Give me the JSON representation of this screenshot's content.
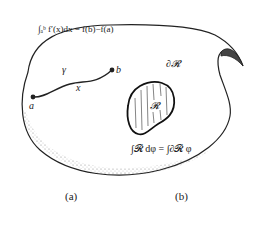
{
  "figure": {
    "panel_a": {
      "caption": "(a)",
      "formula": "∫ₐᵇ f′(x)dx = f(b)−f(a)",
      "curve_label": "γ",
      "variable_label": "x",
      "start_point_label": "a",
      "end_point_label": "b"
    },
    "panel_b": {
      "caption": "(b)",
      "region_label": "𝓡",
      "boundary_label": "∂𝓡",
      "formula": "∫𝓡 dφ = ∫∂𝓡 φ"
    },
    "colors": {
      "ink": "#222222",
      "background": "#ffffff"
    }
  }
}
